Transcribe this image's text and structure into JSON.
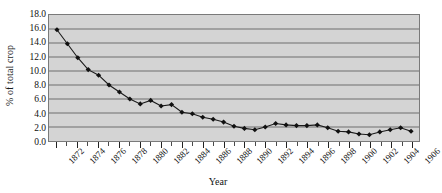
{
  "chart_data": {
    "type": "line",
    "title": "",
    "xlabel": "Year",
    "ylabel": "% of total crop",
    "ylim": [
      0.0,
      18.0
    ],
    "yticks": [
      "0.0",
      "2.0",
      "4.0",
      "6.0",
      "8.0",
      "10.0",
      "12.0",
      "14.0",
      "16.0",
      "18.0"
    ],
    "ytick_values": [
      0.0,
      2.0,
      4.0,
      6.0,
      8.0,
      10.0,
      12.0,
      14.0,
      16.0,
      18.0
    ],
    "grid": true,
    "legend": "none",
    "marker": "diamond",
    "x": [
      1872,
      1873,
      1874,
      1875,
      1876,
      1877,
      1878,
      1879,
      1880,
      1881,
      1882,
      1883,
      1884,
      1885,
      1886,
      1887,
      1888,
      1889,
      1890,
      1891,
      1892,
      1893,
      1894,
      1895,
      1896,
      1897,
      1898,
      1899,
      1900,
      1901,
      1902,
      1903,
      1904,
      1905,
      1906
    ],
    "xtick_labels": [
      "1872",
      "1874",
      "1876",
      "1878",
      "1880",
      "1882",
      "1884",
      "1886",
      "1888",
      "1890",
      "1892",
      "1894",
      "1896",
      "1898",
      "1900",
      "1902",
      "1904",
      "1906"
    ],
    "xtick_values": [
      1872,
      1874,
      1876,
      1878,
      1880,
      1882,
      1884,
      1886,
      1888,
      1890,
      1892,
      1894,
      1896,
      1898,
      1900,
      1902,
      1904,
      1906
    ],
    "values": [
      15.9,
      13.9,
      11.9,
      10.2,
      9.4,
      8.0,
      7.0,
      6.0,
      5.3,
      5.8,
      5.0,
      5.2,
      4.1,
      3.9,
      3.4,
      3.1,
      2.7,
      2.1,
      1.8,
      1.6,
      2.0,
      2.5,
      2.3,
      2.2,
      2.2,
      2.3,
      1.9,
      1.4,
      1.3,
      1.0,
      0.9,
      1.3,
      1.6,
      1.9,
      1.4
    ],
    "series": [
      {
        "name": "% of total crop",
        "values": [
          15.9,
          13.9,
          11.9,
          10.2,
          9.4,
          8.0,
          7.0,
          6.0,
          5.3,
          5.8,
          5.0,
          5.2,
          4.1,
          3.9,
          3.4,
          3.1,
          2.7,
          2.1,
          1.8,
          1.6,
          2.0,
          2.5,
          2.3,
          2.2,
          2.2,
          2.3,
          1.9,
          1.4,
          1.3,
          1.0,
          0.9,
          1.3,
          1.6,
          1.9,
          1.4
        ]
      }
    ],
    "colors": {
      "plot_background": "#d4d4d4",
      "gridline": "#6e6e6e",
      "line": "#1a1a1a",
      "marker": "#111111",
      "axis": "#555555",
      "text": "#111111"
    }
  }
}
